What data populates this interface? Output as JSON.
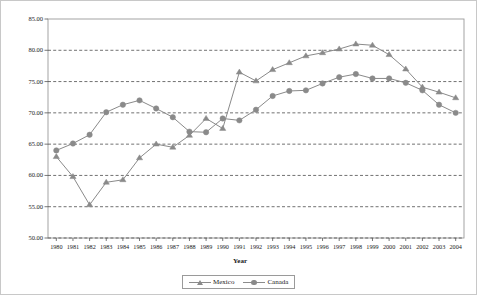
{
  "chart_data": {
    "type": "line",
    "title": "",
    "xlabel": "Year",
    "ylabel": "",
    "grid": true,
    "legend_position": "bottom",
    "ylim": [
      50.0,
      85.0
    ],
    "ytick_labels": [
      "85.00",
      "80.00",
      "75.00",
      "70.00",
      "65.00",
      "60.00",
      "55.00",
      "50.00"
    ],
    "ytick_values": [
      85.0,
      80.0,
      75.0,
      70.0,
      65.0,
      60.0,
      55.0,
      50.0
    ],
    "categories": [
      "1980",
      "1981",
      "1982",
      "1983",
      "1984",
      "1985",
      "1986",
      "1987",
      "1988",
      "1989",
      "1990",
      "1991",
      "1992",
      "1993",
      "1994",
      "1995",
      "1996",
      "1997",
      "1998",
      "1999",
      "2000",
      "2001",
      "2002",
      "2003",
      "2004"
    ],
    "series": [
      {
        "name": "Mexico",
        "marker": "triangle",
        "color": "#8a8a8a",
        "values": [
          63.0,
          59.8,
          55.3,
          58.9,
          59.3,
          62.8,
          65.0,
          64.5,
          66.4,
          69.1,
          67.5,
          76.5,
          75.1,
          76.9,
          78.0,
          79.1,
          79.6,
          80.2,
          81.0,
          80.8,
          79.3,
          77.0,
          74.1,
          73.3,
          72.4
        ]
      },
      {
        "name": "Canada",
        "marker": "circle",
        "color": "#8a8a8a",
        "values": [
          64.0,
          65.1,
          66.5,
          70.1,
          71.3,
          72.0,
          70.7,
          69.3,
          67.0,
          66.9,
          69.1,
          68.8,
          70.5,
          72.7,
          73.5,
          73.6,
          74.7,
          75.7,
          76.2,
          75.5,
          75.5,
          74.8,
          73.6,
          71.3,
          70.0
        ]
      }
    ]
  },
  "legend": {
    "items": [
      {
        "label": "Mexico",
        "marker": "triangle"
      },
      {
        "label": "Canada",
        "marker": "circle"
      }
    ]
  }
}
